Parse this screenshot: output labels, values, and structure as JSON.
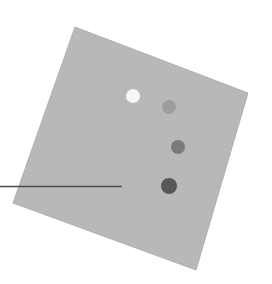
{
  "figure": {
    "canvas": {
      "width": 272,
      "height": 284,
      "background_color": "#ffffff"
    },
    "specimen_plate": {
      "name": "rotated-gray-square",
      "fill_color": "#b8b8b8",
      "edge_color": "#b0b0b0",
      "rotation_degrees": 21,
      "corners": [
        {
          "x": 75,
          "y": 27
        },
        {
          "x": 248,
          "y": 93
        },
        {
          "x": 196,
          "y": 270
        },
        {
          "x": 13,
          "y": 203
        }
      ]
    },
    "markers": [
      {
        "id": "marker-1",
        "label": "",
        "cx": 133,
        "cy": 96,
        "r": 7.0,
        "color": "#f7f7f5",
        "tone": "white"
      },
      {
        "id": "marker-2",
        "label": "",
        "cx": 169,
        "cy": 107,
        "r": 7.0,
        "color": "#9d9d9d",
        "tone": "light-gray"
      },
      {
        "id": "marker-3",
        "label": "",
        "cx": 178,
        "cy": 147,
        "r": 7.0,
        "color": "#7b7b7b",
        "tone": "mid-gray"
      },
      {
        "id": "marker-4",
        "label": "",
        "cx": 169,
        "cy": 186,
        "r": 8.0,
        "color": "#585858",
        "tone": "dark-gray"
      }
    ],
    "leader_line": {
      "name": "annotation-leader-line",
      "color": "#4a4a52",
      "width": 1.4,
      "x1": 0,
      "y1": 186.5,
      "x2": 122,
      "y2": 186.5
    }
  }
}
